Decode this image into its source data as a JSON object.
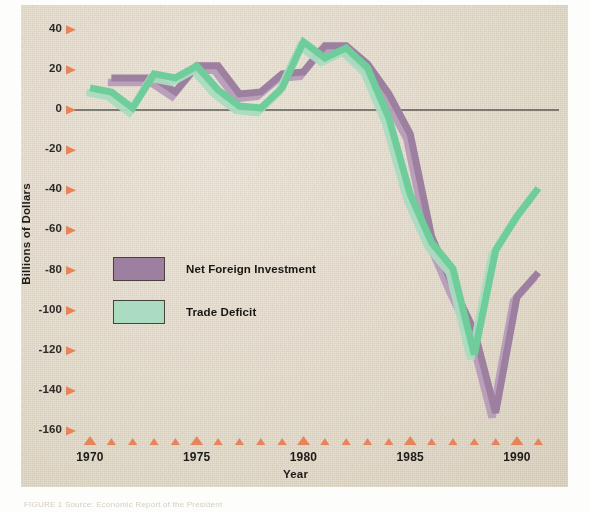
{
  "figure": {
    "background_color": "#ddd3c0",
    "caption_prefix": "FIGURE",
    "caption_text": "FIGURE 1    Source: Economic Report of the President"
  },
  "axes": {
    "y_title": "Billions of Dollars",
    "x_title": "Year",
    "y_ticks": [
      40,
      20,
      0,
      -20,
      -40,
      -60,
      -80,
      -100,
      -120,
      -140,
      -160
    ],
    "y_tick_labels": [
      "40",
      "20",
      "0",
      "-20",
      "-40",
      "-60",
      "-80",
      "-100",
      "-120",
      "-140",
      "-160"
    ],
    "y_limits": [
      -165,
      45
    ],
    "x_limits": [
      1969.5,
      1991.8
    ],
    "x_tick_labels": [
      "1970",
      "1975",
      "1980",
      "1985",
      "1990"
    ],
    "x_tick_values": [
      1970,
      1975,
      1980,
      1985,
      1990
    ],
    "x_minor_ticks": [
      1970,
      1971,
      1972,
      1973,
      1974,
      1975,
      1976,
      1977,
      1978,
      1979,
      1980,
      1981,
      1982,
      1983,
      1984,
      1985,
      1986,
      1987,
      1988,
      1989,
      1990,
      1991
    ],
    "tick_marker_color": "#e8845a",
    "zero_line_color": "#1a1a18",
    "grid": false
  },
  "legend": {
    "position": "inside-left",
    "entries": [
      {
        "label": "Net Foreign Investment",
        "color": "#9d7fa0",
        "border": "#46423d"
      },
      {
        "label": "Trade Deficit",
        "color": "#a9dcc0",
        "border": "#46423d"
      }
    ]
  },
  "chart_data": {
    "type": "line",
    "title": "",
    "subtitle": "",
    "xlabel": "Year",
    "ylabel": "Billions of Dollars",
    "xlim": [
      1969.5,
      1991.8
    ],
    "ylim": [
      -165,
      45
    ],
    "grid": false,
    "legend_position": "inside-left",
    "x": [
      1970,
      1971,
      1972,
      1973,
      1974,
      1975,
      1976,
      1977,
      1978,
      1979,
      1980,
      1981,
      1982,
      1983,
      1984,
      1985,
      1986,
      1987,
      1988,
      1989,
      1990,
      1991
    ],
    "series": [
      {
        "name": "Net Foreign Investment",
        "color": "#9d7fa0",
        "values": [
          null,
          16,
          16,
          16,
          9,
          22,
          22,
          8,
          9,
          18,
          19,
          32,
          32,
          23,
          8,
          -12,
          -63,
          -88,
          -110,
          -151,
          -93,
          -81
        ]
      },
      {
        "name": "Trade Deficit",
        "color": "#6ecd9a",
        "values": [
          11,
          9,
          1,
          18,
          16,
          22,
          10,
          2,
          1,
          11,
          34,
          26,
          31,
          21,
          -4,
          -42,
          -66,
          -79,
          -122,
          -70,
          -53,
          -39
        ]
      }
    ],
    "annotations": []
  }
}
